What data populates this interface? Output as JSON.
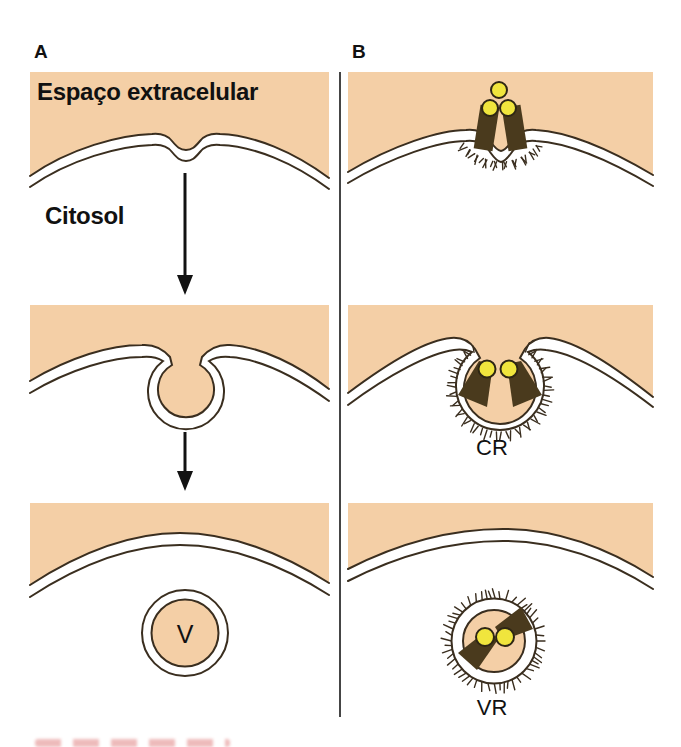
{
  "diagram": {
    "panel_a": {
      "label": "A",
      "extracellular_label": "Espaço extracelular",
      "cytosol_label": "Citosol",
      "vesicle_label": "V"
    },
    "panel_b": {
      "label": "B",
      "coated_pit_label": "CR",
      "coated_vesicle_label": "VR"
    }
  },
  "colors": {
    "extracellular": "#f4cfa6",
    "membrane": "#3a2e1f",
    "receptor": "#4a3a1d",
    "ligand": "#f0e53d",
    "ligand_outline": "#2e2614",
    "divider": "#454545",
    "text": "#111111",
    "caption": "#d96a6a"
  }
}
